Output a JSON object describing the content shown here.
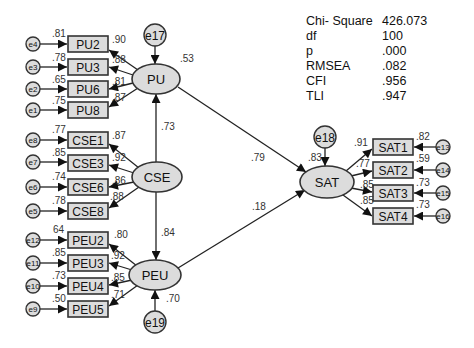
{
  "fit_indices": [
    {
      "label": "Chi- Square",
      "value": "426.073"
    },
    {
      "label": "df",
      "value": "100"
    },
    {
      "label": "p",
      "value": ".000"
    },
    {
      "label": "RMSEA",
      "value": ".082"
    },
    {
      "label": "CFI",
      "value": ".956"
    },
    {
      "label": "TLI",
      "value": ".947"
    }
  ],
  "latents": {
    "PU": {
      "label": "PU",
      "r2": ".53",
      "error": "e17"
    },
    "CSE": {
      "label": "CSE"
    },
    "PEU": {
      "label": "PEU",
      "r2": ".70",
      "error": "e19"
    },
    "SAT": {
      "label": "SAT",
      "r2": ".83",
      "error": "e18"
    }
  },
  "paths": {
    "CSE_PU": ".73",
    "CSE_PEU": ".84",
    "PU_SAT": ".79",
    "PEU_SAT": ".18"
  },
  "indicators": {
    "PU": [
      {
        "name": "PU2",
        "error": "e4",
        "r2": ".81",
        "loading": ".90"
      },
      {
        "name": "PU3",
        "error": "e3",
        "r2": ".78",
        "loading": ".88"
      },
      {
        "name": "PU6",
        "error": "e2",
        "r2": ".65",
        "loading": ".81"
      },
      {
        "name": "PU8",
        "error": "e1",
        "r2": ".75",
        "loading": ".87"
      }
    ],
    "CSE": [
      {
        "name": "CSE1",
        "error": "e8",
        "r2": ".77",
        "loading": ".87"
      },
      {
        "name": "CSE3",
        "error": "e7",
        "r2": ".85",
        "loading": ".92"
      },
      {
        "name": "CSE6",
        "error": "e6",
        "r2": ".74",
        "loading": ".86"
      },
      {
        "name": "CSE8",
        "error": "e5",
        "r2": ".78",
        "loading": ".88"
      }
    ],
    "PEU": [
      {
        "name": "PEU2",
        "error": "e12",
        "r2": "64",
        "loading": ".80"
      },
      {
        "name": "PEU3",
        "error": "e11",
        "r2": ".85",
        "loading": ".92"
      },
      {
        "name": "PEU4",
        "error": "e10",
        "r2": ".73",
        "loading": ".85"
      },
      {
        "name": "PEU5",
        "error": "e9",
        "r2": ".50",
        "loading": ".71"
      }
    ],
    "SAT": [
      {
        "name": "SAT1",
        "error": "e13",
        "r2": ".82",
        "loading": ".91"
      },
      {
        "name": "SAT2",
        "error": "e14",
        "r2": ".59",
        "loading": ".77"
      },
      {
        "name": "SAT3",
        "error": "e15",
        "r2": ".73",
        "loading": ".85"
      },
      {
        "name": "SAT4",
        "error": "e16",
        "r2": ".73",
        "loading": ".85"
      }
    ]
  }
}
